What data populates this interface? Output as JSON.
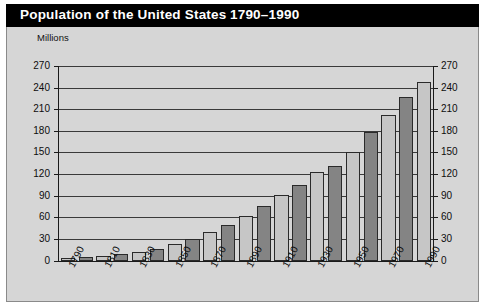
{
  "header": {
    "title": "Population of the United States",
    "range": "1790–1990"
  },
  "axis": {
    "units_label": "Millions"
  },
  "chart_data": {
    "type": "bar",
    "title": "Population of the United States 1790–1990",
    "subtitle": "",
    "xlabel": "",
    "ylabel": "Millions",
    "ylim": [
      0,
      270
    ],
    "ytick_step": 30,
    "yticks": [
      0,
      30,
      60,
      90,
      120,
      150,
      180,
      210,
      240,
      270
    ],
    "ytick_labels_left": [
      "0",
      "30",
      "60",
      "90",
      "120",
      "150",
      "180",
      "210",
      "240",
      "270"
    ],
    "ytick_labels_right": [
      "0",
      "30",
      "60",
      "90",
      "120",
      "150",
      "180",
      "210",
      "240",
      "270"
    ],
    "grid": true,
    "grid_axis": "y",
    "legend": null,
    "legend_position": "none",
    "dual_y_axis": true,
    "categories": [
      "1790",
      "1800",
      "1810",
      "1820",
      "1830",
      "1840",
      "1850",
      "1860",
      "1870",
      "1880",
      "1890",
      "1900",
      "1910",
      "1920",
      "1930",
      "1940",
      "1950",
      "1960",
      "1970",
      "1980",
      "1990"
    ],
    "xtick_labels_shown": [
      "1790",
      "1810",
      "1830",
      "1850",
      "1870",
      "1890",
      "1910",
      "1930",
      "1950",
      "1970",
      "1990"
    ],
    "xtick_label_rotation": -62,
    "values": [
      4,
      5,
      7,
      10,
      13,
      17,
      23,
      31,
      40,
      50,
      63,
      76,
      92,
      106,
      123,
      132,
      151,
      179,
      203,
      227,
      249
    ],
    "bar_colors": {
      "light": "#c6c6c6",
      "dark": "#848484",
      "edge": "#2a2a2a",
      "pattern": "alternating"
    },
    "plot_background": "#d6d6d6",
    "gridline_color": "#3a3a3a",
    "header_background": "#000000",
    "header_text_color": "#ffffff"
  }
}
